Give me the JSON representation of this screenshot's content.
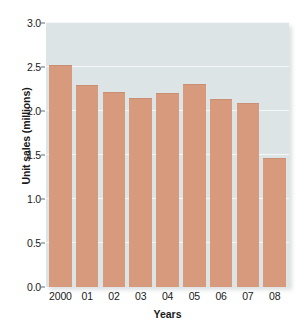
{
  "chart_data": {
    "type": "bar",
    "title": "",
    "xlabel": "Years",
    "ylabel": "Unit sales (millions)",
    "categories": [
      "2000",
      "01",
      "02",
      "03",
      "04",
      "05",
      "06",
      "07",
      "08"
    ],
    "values": [
      2.52,
      2.3,
      2.22,
      2.15,
      2.21,
      2.31,
      2.14,
      2.09,
      1.47
    ],
    "series": [
      {
        "name": "Unit sales",
        "values": [
          2.52,
          2.3,
          2.22,
          2.15,
          2.21,
          2.31,
          2.14,
          2.09,
          1.47
        ]
      }
    ],
    "ylim": [
      0.0,
      3.0
    ],
    "ytick_labels": [
      "0.0",
      "0.5",
      "1.0",
      "1.5",
      "2.0",
      "2.5",
      "3.0"
    ],
    "ytick_values": [
      0.0,
      0.5,
      1.0,
      1.5,
      2.0,
      2.5,
      3.0
    ],
    "grid": true,
    "legend": false,
    "colors": {
      "bar": "#d79a7c",
      "plot_background": "#dde4e6",
      "gridline": "#f4f8f9",
      "text": "#1a1a1a",
      "page_background": "#ffffff"
    }
  }
}
